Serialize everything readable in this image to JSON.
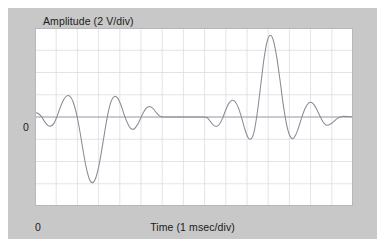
{
  "figure": {
    "panel_bg": "#c8c8c8",
    "plot_bg": "#ffffff",
    "grid_color": "#dcdce4",
    "axis_color": "#9a9aa8",
    "trace_color": "#8a8a92"
  },
  "labels": {
    "y_axis_title": "Amplitude (2 V/div)",
    "x_axis_title": "Time (1 msec/div)",
    "y_zero": "0",
    "x_zero": "0"
  },
  "chart_data": {
    "type": "line",
    "title": "",
    "subtitle": "",
    "xlabel": "Time (1 msec/div)",
    "ylabel": "Amplitude (2 V/div)",
    "x_units": "msec",
    "y_units": "V",
    "x_per_division": 1,
    "y_per_division": 2,
    "x_divisions": 15,
    "y_divisions": 8,
    "xlim": [
      0,
      15
    ],
    "ylim": [
      -8,
      8
    ],
    "grid": true,
    "legend": null,
    "zero_line": 0,
    "tick_labels": {
      "x": [
        "0"
      ],
      "y": [
        "0"
      ]
    },
    "annotations": [],
    "series": [
      {
        "name": "waveform",
        "color": "#8a8a92",
        "x": [
          0.0,
          0.15,
          0.3,
          0.45,
          0.6,
          0.75,
          0.9,
          1.05,
          1.2,
          1.35,
          1.5,
          1.65,
          1.8,
          1.95,
          2.1,
          2.25,
          2.4,
          2.55,
          2.7,
          2.85,
          3.0,
          3.15,
          3.3,
          3.45,
          3.6,
          3.75,
          3.9,
          4.05,
          4.2,
          4.35,
          4.5,
          4.65,
          4.8,
          4.95,
          5.1,
          5.25,
          5.4,
          5.55,
          5.7,
          5.85,
          6.0,
          6.3,
          6.6,
          6.9,
          7.2,
          7.5,
          7.8,
          8.1,
          8.25,
          8.4,
          8.55,
          8.7,
          8.85,
          9.0,
          9.15,
          9.3,
          9.45,
          9.6,
          9.75,
          9.9,
          10.05,
          10.2,
          10.35,
          10.5,
          10.65,
          10.8,
          10.95,
          11.1,
          11.25,
          11.4,
          11.55,
          11.7,
          11.85,
          12.0,
          12.15,
          12.3,
          12.45,
          12.6,
          12.75,
          12.9,
          13.05,
          13.2,
          13.35,
          13.5,
          13.65,
          13.8,
          14.0,
          14.25,
          14.5,
          15.0
        ],
        "y": [
          0.4,
          0.32,
          0.05,
          -0.4,
          -0.75,
          -0.82,
          -0.55,
          0.1,
          0.9,
          1.55,
          1.9,
          1.85,
          1.35,
          0.35,
          -1.1,
          -2.8,
          -4.4,
          -5.5,
          -5.9,
          -5.55,
          -4.5,
          -2.95,
          -1.2,
          0.4,
          1.45,
          1.85,
          1.7,
          1.1,
          0.25,
          -0.5,
          -1.0,
          -1.1,
          -0.8,
          -0.25,
          0.35,
          0.8,
          0.95,
          0.8,
          0.45,
          0.12,
          0.0,
          0.0,
          0.0,
          0.0,
          0.0,
          0.0,
          0.0,
          -0.05,
          -0.35,
          -0.7,
          -0.85,
          -0.65,
          -0.1,
          0.65,
          1.25,
          1.5,
          1.35,
          0.8,
          -0.1,
          -1.1,
          -1.85,
          -1.95,
          -1.2,
          0.6,
          2.9,
          5.2,
          6.8,
          7.35,
          6.85,
          5.4,
          3.4,
          1.25,
          -0.5,
          -1.6,
          -1.95,
          -1.6,
          -0.85,
          0.05,
          0.8,
          1.25,
          1.3,
          1.0,
          0.45,
          -0.15,
          -0.6,
          -0.75,
          -0.55,
          -0.15,
          0.05,
          0.0
        ]
      }
    ]
  }
}
